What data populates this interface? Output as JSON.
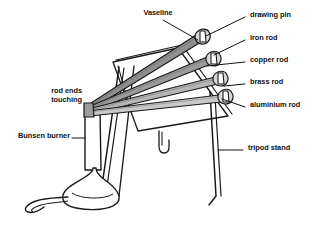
{
  "figure": {
    "background_color": "#ffffff",
    "ink_color": "#1a1a1a",
    "rod_fill_color": "#8c8c8c",
    "rod_light_fill_color": "#c9c9c9",
    "blob_fill_color": "#d9d9d9"
  },
  "labels": {
    "vaseline": "Vaseline",
    "drawing_pin": "drawing pin",
    "iron_rod": "iron rod",
    "copper_rod": "copper rod",
    "brass_rod": "brass rod",
    "aluminium_rod": "aluminium rod",
    "rod_ends_line1": "rod ends",
    "rod_ends_line2": "touching",
    "bunsen_burner": "Bunsen burner",
    "tripod_stand": "tripod stand"
  },
  "parts": {
    "rods": [
      {
        "name": "iron rod",
        "index": 1
      },
      {
        "name": "copper rod",
        "index": 2
      },
      {
        "name": "brass rod",
        "index": 3
      },
      {
        "name": "aluminium rod",
        "index": 4
      }
    ],
    "pin_count": 4,
    "vaseline_blob_count": 4
  }
}
